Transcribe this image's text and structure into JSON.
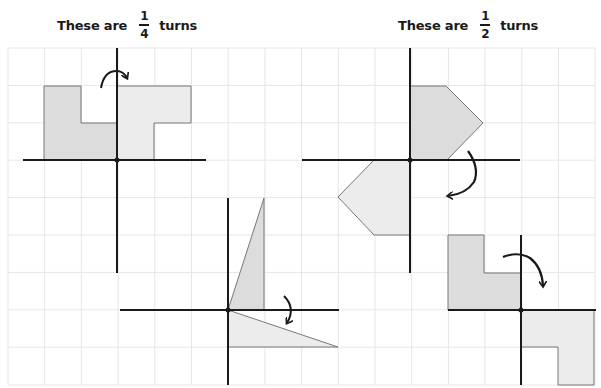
{
  "titles": {
    "quarter": {
      "prefix": "These are",
      "numerator": "1",
      "denominator": "4",
      "suffix": "turns"
    },
    "half": {
      "prefix": "These are",
      "numerator": "1",
      "denominator": "2",
      "suffix": "turns"
    }
  },
  "colors": {
    "grid": "#e6e6e6",
    "axis": "#1a1a1a",
    "original_fill": "#dcdcdc",
    "rotated_fill": "#ececec",
    "shape_stroke": "#777777"
  },
  "figures": [
    {
      "name": "quarter-turn-L-shape",
      "turn": "1/4",
      "direction": "clockwise"
    },
    {
      "name": "quarter-turn-triangle",
      "turn": "1/4",
      "direction": "clockwise"
    },
    {
      "name": "half-turn-pentagon",
      "turn": "1/2",
      "direction": "clockwise"
    },
    {
      "name": "half-turn-L-shape",
      "turn": "1/2",
      "direction": "clockwise"
    }
  ]
}
